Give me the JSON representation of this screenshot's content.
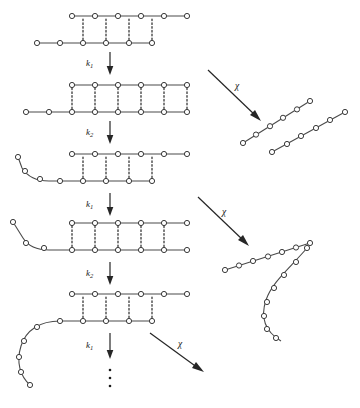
{
  "diagram": {
    "type": "reaction-scheme",
    "background_color": "#ffffff",
    "ink_color": "#3a3a3a",
    "rung_style": "dotted",
    "labels": {
      "rate_k1": "k",
      "rate_k1_sub": "1",
      "rate_k2": "k",
      "rate_k2_sub": "2",
      "chi": "χ",
      "ellipsis": "⋮"
    },
    "vertical_arrows": [
      {
        "name": "step-1",
        "label_base": "k",
        "label_sub": "1",
        "x": 110,
        "y1": 52,
        "y2": 74,
        "label_x": 88,
        "label_y": 66
      },
      {
        "name": "step-2",
        "label_base": "k",
        "label_sub": "2",
        "x": 110,
        "y1": 120,
        "y2": 142,
        "label_x": 88,
        "label_y": 134
      },
      {
        "name": "step-3",
        "label_base": "k",
        "label_sub": "1",
        "x": 110,
        "y1": 193,
        "y2": 215,
        "label_x": 88,
        "label_y": 207
      },
      {
        "name": "step-4",
        "label_base": "k",
        "label_sub": "2",
        "x": 110,
        "y1": 262,
        "y2": 284,
        "label_x": 88,
        "label_y": 276
      },
      {
        "name": "step-5",
        "label_base": "k",
        "label_sub": "1",
        "x": 110,
        "y1": 333,
        "y2": 358,
        "label_x": 88,
        "label_y": 348
      }
    ],
    "diagonal_arrows": [
      {
        "name": "dissociation-1",
        "label": "χ",
        "x1": 208,
        "y1": 70,
        "x2": 258,
        "y2": 118,
        "label_x": 238,
        "label_y": 86
      },
      {
        "name": "dissociation-2",
        "label": "χ",
        "x1": 196,
        "y1": 196,
        "x2": 248,
        "y2": 244,
        "label_x": 226,
        "label_y": 212
      },
      {
        "name": "dissociation-3",
        "label": "χ",
        "x1": 196,
        "y1": 324,
        "y2": 372,
        "x2": 240,
        "label_x": 224,
        "label_y": 340
      }
    ],
    "complexes": [
      {
        "name": "complex-1",
        "top_nodes": 6,
        "bottom_nodes": 6,
        "rungs": 4,
        "tail": "none"
      },
      {
        "name": "complex-2",
        "top_nodes": 6,
        "bottom_nodes": 8,
        "rungs": 6,
        "tail": "none"
      },
      {
        "name": "complex-3",
        "top_nodes": 6,
        "bottom_nodes": 8,
        "rungs": 4,
        "tail": "short-curl"
      },
      {
        "name": "complex-4",
        "top_nodes": 6,
        "bottom_nodes": 9,
        "rungs": 5,
        "tail": "medium-curl"
      },
      {
        "name": "complex-5",
        "top_nodes": 6,
        "bottom_nodes": 8,
        "rungs": 4,
        "tail": "long-curl"
      }
    ],
    "products": [
      {
        "name": "product-strand-1a",
        "nodes": 6,
        "shape": "straight-diagonal"
      },
      {
        "name": "product-strand-1b",
        "nodes": 6,
        "shape": "straight-diagonal"
      },
      {
        "name": "product-strand-2a",
        "nodes": 7,
        "shape": "straight-diagonal"
      },
      {
        "name": "product-strand-2b",
        "nodes": 10,
        "shape": "curved"
      }
    ]
  }
}
